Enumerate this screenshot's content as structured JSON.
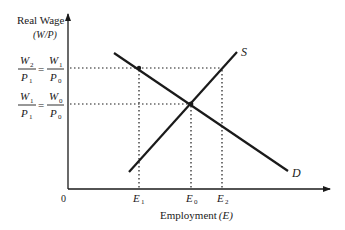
{
  "diagram": {
    "type": "labor-market-supply-demand",
    "y_axis": {
      "label_line1": "Real Wage",
      "label_line2": "(W/P)"
    },
    "x_axis": {
      "label_main": "Employment",
      "label_var": "(E)",
      "origin": "0",
      "ticks": [
        {
          "base": "E",
          "sub": "1"
        },
        {
          "base": "E",
          "sub": "0"
        },
        {
          "base": "E",
          "sub": "2"
        }
      ]
    },
    "wage_levels": [
      {
        "lhs_num": "W",
        "lhs_num_sub": "2",
        "lhs_den": "P",
        "lhs_den_sub": "1",
        "eq": "=",
        "rhs_num": "W",
        "rhs_num_sub": "1",
        "rhs_den": "P",
        "rhs_den_sub": "0"
      },
      {
        "lhs_num": "W",
        "lhs_num_sub": "1",
        "lhs_den": "P",
        "lhs_den_sub": "1",
        "eq": "=",
        "rhs_num": "W",
        "rhs_num_sub": "0",
        "rhs_den": "P",
        "rhs_den_sub": "0"
      }
    ],
    "curves": {
      "supply_label": "S",
      "demand_label": "D"
    }
  }
}
